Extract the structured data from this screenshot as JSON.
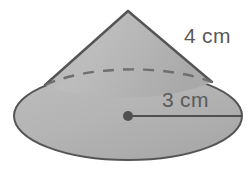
{
  "figure": {
    "name": "cone-diagram",
    "shape": "cone",
    "background_color": "#ffffff",
    "fill_color": "#b3b3b3",
    "fill_color_light": "#c6c6c6",
    "outline_color": "#555555",
    "dash_color": "#6e6e6e",
    "label_color": "#5a5a5a"
  },
  "labels": {
    "slant_height": "4 cm",
    "radius": "3 cm"
  },
  "geometry": {
    "apex": {
      "x": 128,
      "y": 11
    },
    "base_center": {
      "x": 128,
      "y": 116
    },
    "base_rx": 114,
    "base_ry": 44,
    "left_tangent": {
      "x": 45,
      "y": 85
    },
    "right_tangent": {
      "x": 212,
      "y": 82
    },
    "radius_line_end": {
      "x": 242,
      "y": 116
    },
    "center_dot_radius": 5
  },
  "measurements": {
    "slant_height_value": 4,
    "radius_value": 3,
    "unit": "cm"
  }
}
